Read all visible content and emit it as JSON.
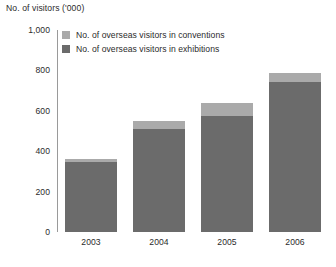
{
  "chart_data": {
    "type": "bar",
    "subtype": "stacked-column",
    "title": "",
    "axis_title": "No. of visitors ('000)",
    "xlabel": "",
    "ylabel": "No. of visitors ('000)",
    "categories": [
      "2003",
      "2004",
      "2005",
      "2006"
    ],
    "ylim": [
      0,
      1000
    ],
    "yticks": [
      0,
      200,
      400,
      600,
      800,
      1000
    ],
    "ytick_labels": [
      "0",
      "200",
      "400",
      "600",
      "800",
      "1,000"
    ],
    "grid": false,
    "legend_position": "top-left",
    "series": [
      {
        "name": "No. of overseas visitors in exhibitions",
        "color": "#6b6b6b",
        "values": [
          345,
          510,
          575,
          745
        ]
      },
      {
        "name": "No. of overseas visitors in conventions",
        "color": "#aaaaaa",
        "values": [
          15,
          40,
          65,
          40
        ]
      }
    ],
    "totals": [
      360,
      550,
      640,
      785
    ]
  },
  "legend": {
    "items": [
      {
        "label": "No. of overseas visitors in conventions",
        "color": "#aaaaaa"
      },
      {
        "label": "No. of overseas visitors in exhibitions",
        "color": "#6b6b6b"
      }
    ]
  },
  "colors": {
    "conventions": "#aaaaaa",
    "exhibitions": "#6b6b6b",
    "axis": "#9a9a9a",
    "text": "#2b2b2b",
    "background": "#ffffff"
  }
}
